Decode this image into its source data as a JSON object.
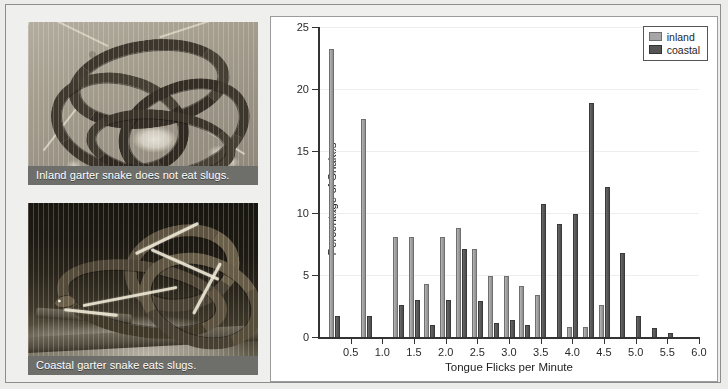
{
  "figure": {
    "photos": [
      {
        "name": "inland-garter-snake",
        "caption": "Inland garter snake does not eat slugs."
      },
      {
        "name": "coastal-garter-snake",
        "caption": "Coastal garter snake eats slugs."
      }
    ]
  },
  "legend": {
    "position": "top-right",
    "entries": [
      {
        "label": "inland",
        "color": "#a6a6a6"
      },
      {
        "label": "coastal",
        "color": "#555555"
      }
    ]
  },
  "chart_data": {
    "type": "bar",
    "title": "",
    "xlabel": "Tongue Flicks per Minute",
    "ylabel": "Percentage of Snakes",
    "xlim": [
      0,
      6.0
    ],
    "ylim": [
      0,
      25
    ],
    "xticks": [
      0.5,
      1.0,
      1.5,
      2.0,
      2.5,
      3.0,
      3.5,
      4.0,
      4.5,
      5.0,
      5.5,
      6.0
    ],
    "xtick_labels": [
      "0.5",
      "1.0",
      "1.5",
      "2.0",
      "2.5",
      "3.0",
      "3.5",
      "4.0",
      "4.5",
      "5.0",
      "5.5",
      "6.0"
    ],
    "yticks": [
      0,
      5,
      10,
      15,
      20,
      25
    ],
    "ytick_labels": [
      "0",
      "5",
      "10",
      "15",
      "20",
      "25"
    ],
    "grid": "horizontal",
    "bin_width": 0.25,
    "x": [
      0.25,
      0.5,
      0.75,
      1.0,
      1.25,
      1.5,
      1.75,
      2.0,
      2.25,
      2.5,
      2.75,
      3.0,
      3.25,
      3.5,
      3.75,
      4.0,
      4.25,
      4.5,
      4.75,
      5.0,
      5.25,
      5.5
    ],
    "series": [
      {
        "name": "inland",
        "color": "#a6a6a6",
        "values": [
          23.2,
          0,
          17.6,
          0,
          8.1,
          8.1,
          4.3,
          8.1,
          8.8,
          7.1,
          4.9,
          4.9,
          4.1,
          3.4,
          0,
          0.8,
          0.8,
          2.6,
          0,
          0,
          0,
          0
        ]
      },
      {
        "name": "coastal",
        "color": "#555555",
        "values": [
          1.7,
          0,
          1.7,
          0,
          2.6,
          3.0,
          1.0,
          3.0,
          7.1,
          2.9,
          1.1,
          1.4,
          1.0,
          10.7,
          9.1,
          9.9,
          18.9,
          12.1,
          6.8,
          1.7,
          0.7,
          0.3
        ]
      }
    ]
  }
}
